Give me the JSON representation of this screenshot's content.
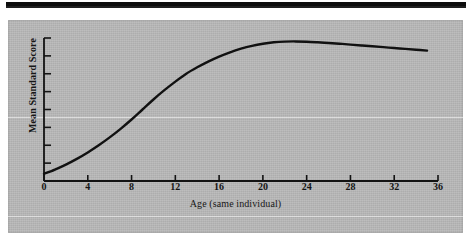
{
  "figure": {
    "background_color": "#b8b8b8",
    "ink_color": "#111111",
    "top_bar_color": "#0d0d0d"
  },
  "chart_data": {
    "type": "line",
    "title": "",
    "subtitle": "",
    "xlabel": "Age (same individual)",
    "ylabel": "Mean Standard Score",
    "xlim": [
      0,
      36
    ],
    "ylim": [
      0,
      100
    ],
    "xticks": [
      0,
      4,
      8,
      12,
      16,
      20,
      24,
      28,
      32,
      36
    ],
    "xtick_labels": [
      "0",
      "4",
      "8",
      "12",
      "16",
      "20",
      "24",
      "28",
      "32",
      "36"
    ],
    "yticks": [
      0,
      12.5,
      25,
      37.5,
      50,
      62.5,
      75,
      87.5,
      100
    ],
    "ytick_labels": [
      "",
      "",
      "",
      "",
      "",
      "",
      "",
      "",
      ""
    ],
    "grid": false,
    "legend": null,
    "annotations": [],
    "series": [
      {
        "name": "Mean Standard Score",
        "color": "#111111",
        "linewidth": 2.4,
        "x": [
          0,
          1,
          2,
          3,
          4,
          5,
          6,
          7,
          8,
          9,
          10,
          11,
          12,
          13,
          14,
          15,
          16,
          17,
          18,
          19,
          20,
          21,
          22,
          23,
          24,
          25,
          26,
          27,
          28,
          29,
          30,
          31,
          32,
          33,
          34,
          35
        ],
        "y": [
          5,
          8,
          11.5,
          15.5,
          20,
          25,
          30.5,
          36.5,
          43,
          50,
          57,
          63.5,
          69.5,
          75,
          79.5,
          83.5,
          87,
          90,
          92.5,
          94.5,
          96,
          97,
          97.5,
          97.6,
          97.4,
          97,
          96.5,
          96,
          95.4,
          94.8,
          94.2,
          93.6,
          93,
          92.4,
          91.8,
          91.2
        ]
      }
    ]
  }
}
